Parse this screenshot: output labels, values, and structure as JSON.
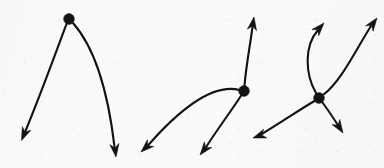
{
  "figure": {
    "title": "Three phase-portrait sketches with arrowed trajectory curves",
    "caption": "",
    "background_color": "#fbfaf8",
    "ink_color": "#151312",
    "canvas": {
      "width": 384,
      "height": 168
    },
    "stroke_width": 2.1,
    "node_radius": 5.2,
    "arrow_length": 13,
    "arrow_half_width": 4.6
  },
  "diagram_data": {
    "type": "vector-field-sketch",
    "panel_count": 3,
    "panels": [
      {
        "id": "panel-1",
        "name": "source-node-two-branches",
        "node": {
          "label": "",
          "x": 69,
          "y": 19,
          "radius": 5.4
        },
        "branch_count": 2,
        "branches": [
          {
            "id": "panel-1-branch-left",
            "name": "branch-down-left",
            "direction": "down-left",
            "path": "M 66.5 24 C 58 47 40 96 25.5 131",
            "arrow": {
              "x": 21.5,
              "y": 140.5,
              "angle_deg": 113
            }
          },
          {
            "id": "panel-1-branch-right",
            "name": "branch-down-right",
            "direction": "down-right",
            "path": "M 73 23 C 88 40 106 74 114.5 147",
            "arrow": {
              "x": 116,
              "y": 157,
              "angle_deg": 83
            }
          }
        ]
      },
      {
        "id": "panel-2",
        "name": "saddle-node-three-branches",
        "node": {
          "label": "",
          "x": 244,
          "y": 91,
          "radius": 5.4
        },
        "branch_count": 3,
        "branches": [
          {
            "id": "panel-2-branch-up",
            "name": "branch-up",
            "direction": "up",
            "path": "M 244.5 86 C 246 66 250 46 252.5 27",
            "arrow": {
              "x": 254,
              "y": 17,
              "angle_deg": -81
            }
          },
          {
            "id": "panel-2-branch-left",
            "name": "branch-down-left-outer",
            "direction": "down-left",
            "path": "M 239.5 90 C 216 84 186 102 147.5 146",
            "arrow": {
              "x": 141,
              "y": 152,
              "angle_deg": 137
            }
          },
          {
            "id": "panel-2-branch-lower",
            "name": "branch-down-left-inner",
            "direction": "down-left",
            "path": "M 241.5 95 C 232 110 216 131 205.5 148",
            "arrow": {
              "x": 200,
              "y": 155,
              "angle_deg": 128
            }
          }
        ]
      },
      {
        "id": "panel-3",
        "name": "crossing-node-four-branches",
        "node": {
          "label": "",
          "x": 319,
          "y": 98,
          "radius": 5.4
        },
        "branch_count": 4,
        "branches": [
          {
            "id": "panel-3-branch-up-left",
            "name": "branch-up-curving",
            "direction": "up",
            "path": "M 316 93 C 305 74 304 46 318 30",
            "arrow": {
              "x": 324,
              "y": 23,
              "angle_deg": -48
            }
          },
          {
            "id": "panel-3-branch-up-right",
            "name": "branch-up-right",
            "direction": "up-right",
            "path": "M 323.5 94.5 C 341 82 358 46 371 26",
            "arrow": {
              "x": 377,
              "y": 18,
              "angle_deg": -54
            }
          },
          {
            "id": "panel-3-branch-down-left",
            "name": "branch-down-left",
            "direction": "down-left",
            "path": "M 314.5 101 C 299 110 282 122 261 134.5",
            "arrow": {
              "x": 253,
              "y": 138,
              "angle_deg": 160
            }
          },
          {
            "id": "panel-3-branch-down-right",
            "name": "branch-down-right",
            "direction": "down-right",
            "path": "M 322.5 102.5 C 328 110 334 119 338.5 126",
            "arrow": {
              "x": 343,
              "y": 133,
              "angle_deg": 57
            }
          }
        ]
      }
    ]
  }
}
